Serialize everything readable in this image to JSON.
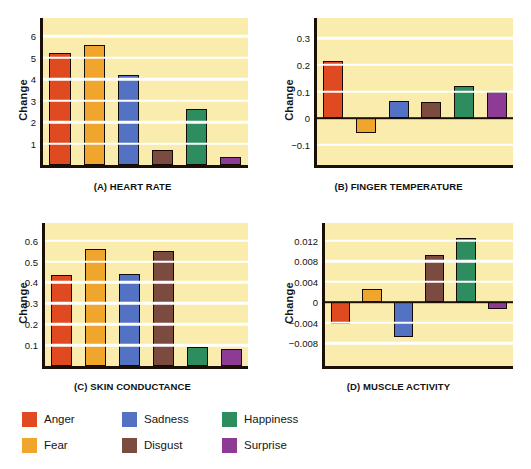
{
  "legend": {
    "items": [
      {
        "label": "Anger",
        "color": "#e04a20"
      },
      {
        "label": "Fear",
        "color": "#f0a52c"
      },
      {
        "label": "Sadness",
        "color": "#5372c4"
      },
      {
        "label": "Disgust",
        "color": "#7c4b40"
      },
      {
        "label": "Happiness",
        "color": "#2e8d5e"
      },
      {
        "label": "Surprise",
        "color": "#8d3b94"
      }
    ]
  },
  "chart_data": [
    {
      "type": "bar",
      "panel": "A",
      "title": "(A) HEART RATE",
      "ylabel": "Change",
      "categories": [
        "Anger",
        "Fear",
        "Sadness",
        "Disgust",
        "Happiness",
        "Surprise"
      ],
      "values": [
        5.2,
        5.6,
        4.2,
        0.7,
        2.6,
        0.35
      ],
      "yticks": [
        1,
        2,
        3,
        4,
        5,
        6
      ],
      "yticklabels": [
        "1",
        "2",
        "3",
        "4",
        "5",
        "6"
      ],
      "ylim": [
        0,
        6.85
      ],
      "grid": true,
      "zero_line": false
    },
    {
      "type": "bar",
      "panel": "B",
      "title": "(B) FINGER TEMPERATURE",
      "ylabel": "Change",
      "categories": [
        "Anger",
        "Fear",
        "Sadness",
        "Disgust",
        "Happiness",
        "Surprise"
      ],
      "values": [
        0.215,
        -0.055,
        0.065,
        0.062,
        0.122,
        0.098
      ],
      "yticks": [
        -0.1,
        0,
        0.1,
        0.2,
        0.3
      ],
      "yticklabels": [
        "−0.1",
        "0",
        "0.1",
        "0.2",
        "0.3"
      ],
      "ylim": [
        -0.175,
        0.375
      ],
      "grid": true,
      "zero_line": true
    },
    {
      "type": "bar",
      "panel": "C",
      "title": "(C) SKIN CONDUCTANCE",
      "ylabel": "Change",
      "categories": [
        "Anger",
        "Fear",
        "Sadness",
        "Disgust",
        "Happiness",
        "Surprise"
      ],
      "values": [
        0.435,
        0.56,
        0.44,
        0.55,
        0.09,
        0.08
      ],
      "yticks": [
        0.1,
        0.2,
        0.3,
        0.4,
        0.5,
        0.6
      ],
      "yticklabels": [
        "0.1",
        "0.2",
        "0.3",
        "0.4",
        "0.5",
        "0.6"
      ],
      "ylim": [
        0,
        0.685
      ],
      "grid": true,
      "zero_line": false
    },
    {
      "type": "bar",
      "panel": "D",
      "title": "(D) MUSCLE ACTIVITY",
      "ylabel": "Change",
      "categories": [
        "Anger",
        "Fear",
        "Sadness",
        "Disgust",
        "Happiness",
        "Surprise"
      ],
      "values": [
        -0.0042,
        0.0026,
        -0.0068,
        0.0092,
        0.0125,
        -0.0014
      ],
      "yticks": [
        -0.008,
        -0.004,
        0,
        0.004,
        0.008,
        0.012
      ],
      "yticklabels": [
        "−0.008",
        "−0.004",
        "0",
        "0.004",
        "0.008",
        "0.012"
      ],
      "ylim": [
        -0.0125,
        0.0155
      ],
      "grid": true,
      "zero_line": true
    }
  ]
}
